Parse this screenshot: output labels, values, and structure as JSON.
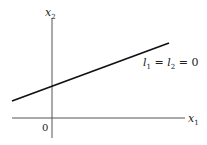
{
  "diagram": {
    "type": "line-in-plane",
    "axes": {
      "x_label": "x",
      "x_sub": "1",
      "y_label": "x",
      "y_sub": "2",
      "origin_label": "0"
    },
    "line": {
      "label_parts": [
        {
          "text": "l",
          "sub": "1"
        },
        {
          "text": " = "
        },
        {
          "text": "l",
          "sub": "2"
        },
        {
          "text": " = 0"
        }
      ],
      "label_plain": "l1 = l2 = 0",
      "from": [
        12,
        101
      ],
      "to": [
        169,
        43
      ]
    },
    "colors": {
      "axis": "#555555",
      "line": "#111111",
      "text": "#222222"
    }
  }
}
